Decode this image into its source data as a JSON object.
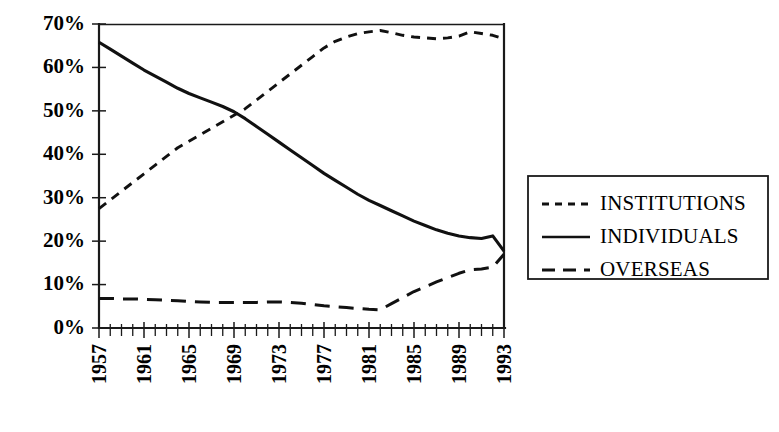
{
  "chart_data": {
    "type": "line",
    "title": "",
    "subtitle": "",
    "xlabel": "",
    "ylabel": "",
    "xlim": [
      1957,
      1993
    ],
    "ylim": [
      0,
      70
    ],
    "grid": false,
    "legend_position": "right",
    "y_ticks": [
      "0%",
      "10%",
      "20%",
      "30%",
      "40%",
      "50%",
      "60%",
      "70%"
    ],
    "y_tick_values": [
      0,
      10,
      20,
      30,
      40,
      50,
      60,
      70
    ],
    "x_ticks": [
      "1957",
      "1961",
      "1965",
      "1969",
      "1973",
      "1977",
      "1981",
      "1985",
      "1989",
      "1993"
    ],
    "x_tick_values": [
      1957,
      1961,
      1965,
      1969,
      1973,
      1977,
      1981,
      1985,
      1989,
      1993
    ],
    "x_minor_tick_step": 1,
    "x": [
      1957,
      1958,
      1959,
      1960,
      1961,
      1962,
      1963,
      1964,
      1965,
      1966,
      1967,
      1968,
      1969,
      1970,
      1971,
      1972,
      1973,
      1974,
      1975,
      1976,
      1977,
      1978,
      1979,
      1980,
      1981,
      1982,
      1983,
      1984,
      1985,
      1986,
      1987,
      1988,
      1989,
      1990,
      1991,
      1992,
      1993
    ],
    "series": [
      {
        "name": "INSTITUTIONS",
        "style": "short-dashed",
        "values": [
          27.5,
          29.5,
          31.5,
          33.5,
          35.5,
          37.5,
          39.5,
          41.5,
          43.0,
          44.5,
          46.0,
          47.5,
          49.0,
          50.5,
          52.5,
          54.5,
          56.5,
          58.5,
          60.5,
          62.5,
          64.5,
          66.0,
          67.0,
          67.8,
          68.2,
          68.5,
          68.0,
          67.4,
          67.0,
          66.8,
          66.6,
          66.8,
          67.2,
          68.2,
          67.8,
          67.4,
          66.6
        ]
      },
      {
        "name": "INDIVIDUALS",
        "style": "solid",
        "values": [
          65.8,
          64.2,
          62.6,
          61.0,
          59.4,
          58.0,
          56.6,
          55.2,
          54.0,
          53.0,
          52.0,
          51.0,
          49.8,
          48.2,
          46.4,
          44.6,
          42.8,
          41.0,
          39.2,
          37.4,
          35.6,
          34.0,
          32.4,
          30.8,
          29.4,
          28.2,
          27.0,
          25.8,
          24.6,
          23.6,
          22.6,
          21.8,
          21.2,
          20.8,
          20.6,
          21.2,
          17.7
        ]
      },
      {
        "name": "OVERSEAS",
        "style": "long-dashed",
        "values": [
          6.8,
          6.8,
          6.7,
          6.7,
          6.6,
          6.5,
          6.4,
          6.3,
          6.1,
          6.0,
          5.9,
          5.9,
          5.9,
          5.9,
          5.9,
          6.0,
          6.0,
          5.9,
          5.7,
          5.4,
          5.1,
          4.9,
          4.7,
          4.5,
          4.3,
          4.2,
          5.6,
          7.0,
          8.4,
          9.5,
          10.6,
          11.6,
          12.6,
          13.4,
          13.6,
          14.0,
          17.0
        ]
      }
    ],
    "legend": [
      {
        "label": "INSTITUTIONS",
        "style": "short-dashed"
      },
      {
        "label": "INDIVIDUALS",
        "style": "solid"
      },
      {
        "label": "OVERSEAS",
        "style": "long-dashed"
      }
    ],
    "colors": {
      "line": "#111111",
      "axis": "#1a1a1a",
      "background": "#ffffff"
    }
  }
}
